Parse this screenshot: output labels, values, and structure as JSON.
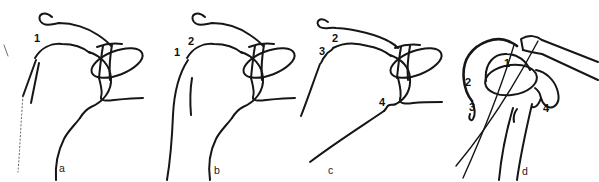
{
  "figure": {
    "panels": [
      {
        "letter": "a",
        "numbers": {
          "n1": "1"
        }
      },
      {
        "letter": "b",
        "numbers": {
          "n1": "1",
          "n2": "2"
        }
      },
      {
        "letter": "c",
        "numbers": {
          "n2": "2",
          "n3": "3",
          "n4": "4"
        }
      },
      {
        "letter": "d",
        "numbers": {
          "n1": "1",
          "n2": "2",
          "n3": "3",
          "n4": "4"
        }
      }
    ]
  },
  "colors": {
    "ink": "#161616",
    "background": "#ffffff",
    "faint_line": "#6f6f6f"
  }
}
